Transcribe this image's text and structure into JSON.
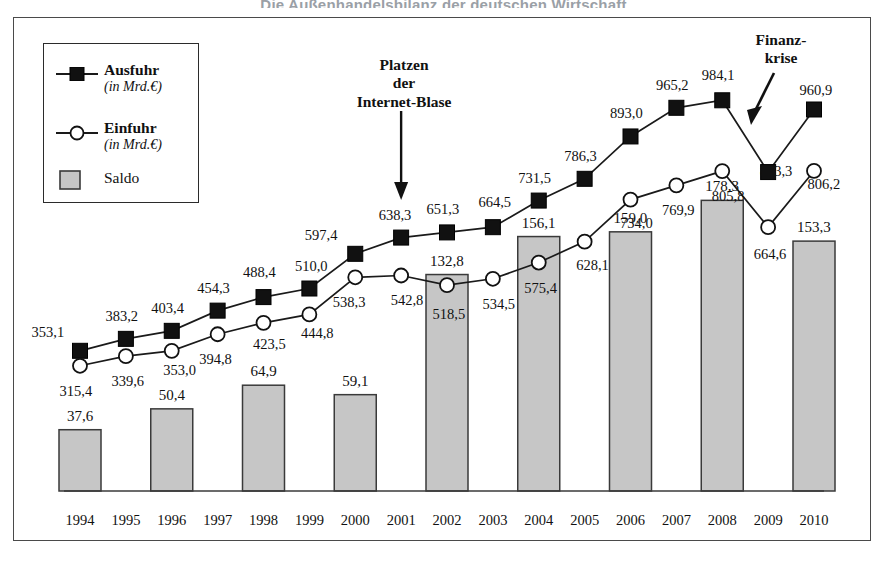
{
  "page": {
    "title": "Die Außenhandelsbilanz der deutschen Wirtschaft",
    "caption": ""
  },
  "legend": {
    "items": [
      {
        "label": "Ausfuhr",
        "sub": "(in Mrd.€)",
        "symbol": "filled-square-line"
      },
      {
        "label": "Einfuhr",
        "sub": "(in Mrd.€)",
        "symbol": "open-circle-line"
      },
      {
        "label": "Saldo",
        "sub": "",
        "symbol": "grey-square"
      }
    ]
  },
  "annotations": [
    {
      "name": "internet-bubble",
      "lines": [
        "Platzen",
        "der",
        "Internet-Blase"
      ],
      "arrow": "down"
    },
    {
      "name": "financial-crisis",
      "lines": [
        "Finanz-",
        "krise"
      ],
      "arrow": "down-left"
    }
  ],
  "colors": {
    "line": "#1a1a1a",
    "bar_fill": "#c6c6c6",
    "bar_stroke": "#3a3a3a",
    "frame": "#4a4a4a",
    "text": "#111111"
  },
  "chart_data": {
    "type": "line",
    "title": "Die Außenhandelsbilanz der deutschen Wirtschaft",
    "xlabel": "",
    "ylabel": "in Mrd. €",
    "grid": false,
    "legend_position": "top-left",
    "categories": [
      "1994",
      "1995",
      "1996",
      "1997",
      "1998",
      "1999",
      "2000",
      "2001",
      "2002",
      "2003",
      "2004",
      "2005",
      "2006",
      "2007",
      "2008",
      "2009",
      "2010"
    ],
    "series": [
      {
        "name": "Ausfuhr",
        "unit": "Mrd. €",
        "marker": "filled-square",
        "values": [
          353.1,
          383.2,
          403.4,
          454.3,
          488.4,
          510.0,
          597.4,
          638.3,
          651.3,
          664.5,
          731.5,
          786.3,
          893.0,
          965.2,
          984.1,
          803.3,
          960.9
        ],
        "labels": [
          "353,1",
          "383,2",
          "403,4",
          "454,3",
          "488,4",
          "510,0",
          "597,4",
          "638,3",
          "651,3",
          "664,5",
          "731,5",
          "786,3",
          "893,0",
          "965,2",
          "984,1",
          "803,3",
          "960,9"
        ]
      },
      {
        "name": "Einfuhr",
        "unit": "Mrd. €",
        "marker": "open-circle",
        "values": [
          315.4,
          339.6,
          353.0,
          394.8,
          423.5,
          444.8,
          538.3,
          542.8,
          518.5,
          534.5,
          575.4,
          628.1,
          734.0,
          769.9,
          805.8,
          664.6,
          806.2
        ],
        "labels": [
          "315,4",
          "339,6",
          "353,0",
          "394,8",
          "423,5",
          "444,8",
          "538,3",
          "542,8",
          "518,5",
          "534,5",
          "575,4",
          "628,1",
          "734,0",
          "769,9",
          "805,8",
          "664,6",
          "806,2"
        ]
      },
      {
        "name": "Saldo",
        "unit": "Mrd. €",
        "marker": "bar",
        "bar_years": [
          "1994",
          "1996",
          "1998",
          "2000",
          "2002",
          "2004",
          "2006",
          "2008",
          "2010"
        ],
        "bar_values": [
          37.6,
          50.4,
          64.9,
          59.1,
          132.8,
          156.1,
          159.0,
          178.3,
          153.3
        ],
        "bar_labels": [
          "37,6",
          "50,4",
          "64,9",
          "59,1",
          "132,8",
          "156,1",
          "159,0",
          "178,3",
          "153,3"
        ]
      }
    ],
    "ylim": [
      0,
      1050
    ]
  }
}
